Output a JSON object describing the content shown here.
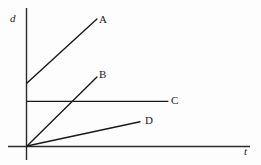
{
  "chart_data": {
    "type": "line",
    "title": "",
    "subtitle": "",
    "xlabel": "t",
    "ylabel": "d",
    "xlim": [
      0,
      10
    ],
    "ylim": [
      0,
      10
    ],
    "grid": false,
    "legend_position": "inline-right-of-line-end",
    "annotations": [
      "Four distance-vs-time lines labeled A, B, C, D",
      "Line A: positive intercept, steep positive slope",
      "Line B: through origin, moderate positive slope",
      "Line C: horizontal, constant positive d",
      "Line D: through origin, shallow positive slope"
    ],
    "series": [
      {
        "name": "A",
        "label": "A",
        "color": "#1a1a1a",
        "x": [
          0,
          5.05
        ],
        "y": [
          4.51,
          9.11
        ],
        "intercept": 4.51,
        "slope": 0.91
      },
      {
        "name": "B",
        "label": "B",
        "color": "#1a1a1a",
        "x": [
          0,
          5.05
        ],
        "y": [
          0,
          4.94
        ],
        "intercept": 0,
        "slope": 0.98
      },
      {
        "name": "C",
        "label": "C",
        "color": "#1a1a1a",
        "x": [
          0,
          10.18
        ],
        "y": [
          3.2,
          3.2
        ],
        "intercept": 3.2,
        "slope": 0
      },
      {
        "name": "D",
        "label": "D",
        "color": "#1a1a1a",
        "x": [
          0,
          8.16
        ],
        "y": [
          0,
          1.74
        ],
        "intercept": 0,
        "slope": 0.21
      }
    ],
    "axis_ticks": {
      "x": [],
      "y": []
    }
  },
  "axes": {
    "y_axis_label": "d",
    "x_axis_label": "t"
  },
  "labels": {
    "a": "A",
    "b": "B",
    "c": "C",
    "d": "D"
  },
  "colors": {
    "background": "#fdfdfd",
    "ink": "#1a1a1a",
    "axis": "#2a2a2a"
  }
}
